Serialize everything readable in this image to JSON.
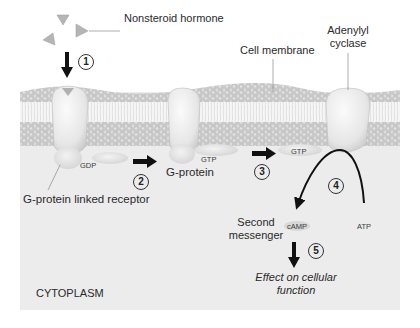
{
  "diagram": {
    "type": "signal-transduction-pathway",
    "labels": {
      "hormone": "Nonsteroid hormone",
      "cell_membrane": "Cell membrane",
      "adenylyl_cyclase": "Adenylyl cyclase",
      "adenylyl_cyclase_line1": "Adenylyl",
      "adenylyl_cyclase_line2": "cyclase",
      "receptor": "G-protein linked receptor",
      "g_protein": "G-protein",
      "gdp": "GDP",
      "gtp_1": "GTP",
      "gtp_2": "GTP",
      "second_messenger_line1": "Second",
      "second_messenger_line2": "messenger",
      "camp": "cAMP",
      "atp": "ATP",
      "effect_line1": "Effect on cellular",
      "effect_line2": "function",
      "cytoplasm": "CYTOPLASM"
    },
    "steps": [
      {
        "number": "1",
        "description": "Hormone binds receptor"
      },
      {
        "number": "2",
        "description": "Receptor activates G-protein"
      },
      {
        "number": "3",
        "description": "GTP-bound G-protein moves to adenylyl cyclase"
      },
      {
        "number": "4",
        "description": "Adenylyl cyclase converts ATP to cAMP"
      },
      {
        "number": "5",
        "description": "cAMP produces effect on cellular function"
      }
    ],
    "colors": {
      "cytoplasm": "#ebebeb",
      "membrane_heads": "#cfcfcf",
      "membrane_tails": "#f4f4f4",
      "protein": "#f0f0f0",
      "arrow": "#111111",
      "hormone": "#b5b5b5"
    }
  }
}
